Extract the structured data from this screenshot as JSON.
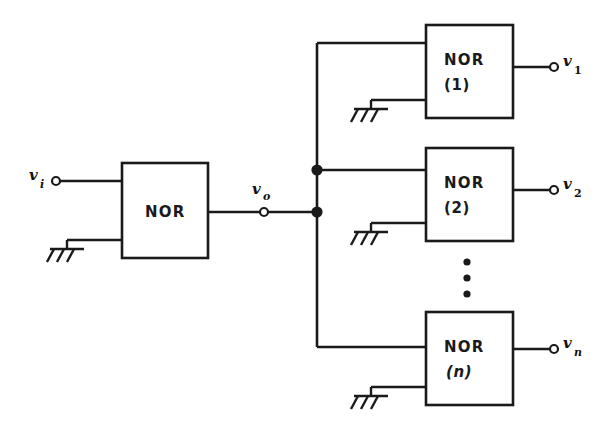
{
  "figure": {
    "kind": "logic-circuit-diagram",
    "colors": {
      "ink": "#1a1a1a",
      "background": "#ffffff"
    }
  },
  "driver_gate": {
    "label": "NOR",
    "index": "",
    "name": "driver-nor-gate"
  },
  "load_gates": [
    {
      "label": "NOR",
      "index": "(1)",
      "index_italic": false,
      "output": "v",
      "output_sub": "1",
      "output_sub_italic": false
    },
    {
      "label": "NOR",
      "index": "(2)",
      "index_italic": false,
      "output": "v",
      "output_sub": "2",
      "output_sub_italic": false
    },
    {
      "label": "NOR",
      "index": "(n)",
      "index_italic": true,
      "output": "v",
      "output_sub": "n",
      "output_sub_italic": true
    }
  ],
  "terminals": {
    "input": {
      "symbol": "v",
      "subscript": "i",
      "subscript_italic": true
    },
    "output": {
      "symbol": "v",
      "subscript": "o",
      "subscript_italic": true
    }
  },
  "ground_symbols": {
    "count": 4,
    "style": "hatched-earth",
    "name": "ground-symbol"
  },
  "ellipsis": {
    "dots": 3,
    "orientation": "vertical",
    "meaning": "gates 3 through n-1 omitted"
  },
  "junctions": {
    "count": 2,
    "name": "wire-junction-dot"
  }
}
